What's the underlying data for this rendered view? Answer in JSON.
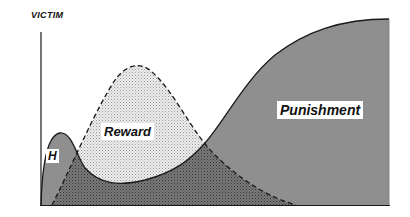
{
  "diagram": {
    "y_axis_label": "VICTIM",
    "curves": [
      {
        "id": "h",
        "label": "H",
        "fill": "gray",
        "stroke": "solid"
      },
      {
        "id": "reward",
        "label": "Reward",
        "fill": "light-stipple",
        "stroke": "dashed"
      },
      {
        "id": "punishment",
        "label": "Punishment",
        "fill": "gray",
        "stroke": "solid"
      }
    ],
    "colors": {
      "punishment_fill": "#8f8f8f",
      "reward_fill": "#e2e2e2",
      "overlap_fill": "#6f6f6f",
      "stroke": "#1a1a1a"
    }
  }
}
